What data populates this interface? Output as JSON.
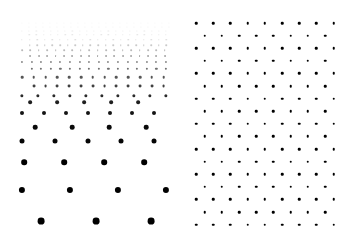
{
  "figure": {
    "title": "",
    "background_color": "#ffffff",
    "dot_color": "#000000",
    "width": 354,
    "height": 244,
    "panel_count": 2
  },
  "chart_data": {
    "type": "scatter",
    "title": "",
    "subtitle": "",
    "xlabel": "",
    "ylabel": "",
    "grid": false,
    "legend": null,
    "axis_visible": false,
    "tick_labels": [],
    "annotations": [],
    "panels": [
      {
        "name": "left-panel-graded-lattice",
        "label": "",
        "description": "Staggered dot lattice that dilates downward: spacing, dot radius and darkness all increase with vertical position.",
        "x_range": [
          20,
          172
        ],
        "y_range": [
          22,
          228
        ],
        "uniform": false,
        "dot_color": "#000000",
        "rows": [
          {
            "y": 23,
            "radius": 0.55,
            "opacity": 0.05,
            "x_start": 22,
            "pitch": 7.0,
            "count": 22,
            "offset": 0.0
          },
          {
            "y": 27,
            "radius": 0.6,
            "opacity": 0.07,
            "x_start": 25.5,
            "pitch": 7.0,
            "count": 21,
            "offset": 0.5
          },
          {
            "y": 31,
            "radius": 0.62,
            "opacity": 0.09,
            "x_start": 22,
            "pitch": 7.2,
            "count": 21,
            "offset": 0.0
          },
          {
            "y": 35,
            "radius": 0.68,
            "opacity": 0.12,
            "x_start": 25.6,
            "pitch": 7.2,
            "count": 20,
            "offset": 0.5
          },
          {
            "y": 40,
            "radius": 0.72,
            "opacity": 0.16,
            "x_start": 22,
            "pitch": 7.6,
            "count": 20,
            "offset": 0.0
          },
          {
            "y": 45,
            "radius": 0.78,
            "opacity": 0.21,
            "x_start": 25.8,
            "pitch": 7.6,
            "count": 19,
            "offset": 0.5
          },
          {
            "y": 50,
            "radius": 0.85,
            "opacity": 0.28,
            "x_start": 22,
            "pitch": 8.4,
            "count": 18,
            "offset": 0.0
          },
          {
            "y": 56,
            "radius": 0.95,
            "opacity": 0.36,
            "x_start": 26.2,
            "pitch": 8.4,
            "count": 17,
            "offset": 0.5
          },
          {
            "y": 62,
            "radius": 1.05,
            "opacity": 0.46,
            "x_start": 22,
            "pitch": 9.6,
            "count": 16,
            "offset": 0.0
          },
          {
            "y": 69,
            "radius": 1.15,
            "opacity": 0.56,
            "x_start": 26.8,
            "pitch": 9.6,
            "count": 15,
            "offset": 0.5
          },
          {
            "y": 77,
            "radius": 1.3,
            "opacity": 0.66,
            "x_start": 22,
            "pitch": 11.8,
            "count": 13,
            "offset": 0.0
          },
          {
            "y": 86,
            "radius": 1.45,
            "opacity": 0.75,
            "x_start": 27.9,
            "pitch": 11.8,
            "count": 12,
            "offset": 0.5
          },
          {
            "y": 96,
            "radius": 1.65,
            "opacity": 0.83,
            "x_start": 22,
            "pitch": 16.0,
            "count": 10,
            "offset": 0.0
          },
          {
            "y": 102,
            "radius": 1.85,
            "opacity": 0.88,
            "x_start": 30,
            "pitch": 27.0,
            "count": 5,
            "offset": 0.0
          },
          {
            "y": 113,
            "radius": 2.0,
            "opacity": 0.92,
            "x_start": 22,
            "pitch": 22.0,
            "count": 7,
            "offset": 0.0
          },
          {
            "y": 127,
            "radius": 2.3,
            "opacity": 0.96,
            "x_start": 35,
            "pitch": 37.0,
            "count": 4,
            "offset": 0.0
          },
          {
            "y": 141,
            "radius": 2.5,
            "opacity": 0.98,
            "x_start": 22,
            "pitch": 33.0,
            "count": 5,
            "offset": 0.0
          },
          {
            "y": 162,
            "radius": 2.8,
            "opacity": 1.0,
            "x_start": 24,
            "pitch": 40.0,
            "count": 4,
            "offset": 0.0
          },
          {
            "y": 190,
            "radius": 3.1,
            "opacity": 1.0,
            "x_start": 22,
            "pitch": 48.0,
            "count": 4,
            "offset": 0.0
          },
          {
            "y": 221,
            "radius": 3.4,
            "opacity": 1.0,
            "x_start": 41,
            "pitch": 55.0,
            "count": 3,
            "offset": 0.0
          }
        ]
      },
      {
        "name": "right-panel-uniform-lattice",
        "label": "",
        "description": "Uniform staggered hexagonal dot lattice: constant column pitch, row pitch, dot radius and full opacity throughout.",
        "x_range": [
          196,
          340
        ],
        "y_range": [
          22,
          228
        ],
        "uniform": true,
        "dot_color": "#000000",
        "uniform_spec": {
          "x_start": 196,
          "y_start": 23,
          "col_pitch": 17.2,
          "row_pitch": 12.6,
          "cols": 9,
          "rows": 17,
          "radius": 1.25,
          "opacity": 1.0,
          "stagger_offset": 0.5
        }
      }
    ]
  }
}
